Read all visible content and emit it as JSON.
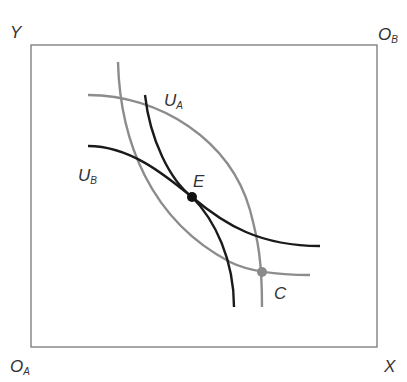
{
  "diagram": {
    "axes": {
      "y_label": "Y",
      "x_label": "X",
      "origin_a": {
        "main": "O",
        "sub": "A"
      },
      "origin_b": {
        "main": "O",
        "sub": "B"
      }
    },
    "curves": {
      "ua_label": {
        "main": "U",
        "sub": "A"
      },
      "ub_label": {
        "main": "U",
        "sub": "B"
      }
    },
    "points": {
      "e_label": "E",
      "c_label": "C"
    },
    "colors": {
      "box": "#777777",
      "black_curve": "#1a1a1a",
      "gray_curve": "#8c8c8c",
      "point_e": "#111111",
      "point_c": "#8a8a8a"
    }
  }
}
